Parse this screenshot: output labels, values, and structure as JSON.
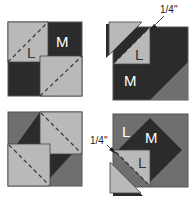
{
  "colors": {
    "dark": "#2b2b2b",
    "medium": "#6f6f6f",
    "light": "#b9b9b9",
    "outline": "#555555",
    "dash": "#333333"
  },
  "panels": [
    {
      "id": "step-1",
      "labels": {
        "large": "L",
        "medium": "M"
      }
    },
    {
      "id": "step-2",
      "labels": {
        "large": "L",
        "medium": "M"
      },
      "seam_allowance": "1/4\""
    },
    {
      "id": "step-3",
      "labels": {}
    },
    {
      "id": "step-4",
      "labels": {
        "large_top": "L",
        "medium": "M",
        "large_bottom": "L"
      },
      "seam_allowance": "1/4\""
    }
  ]
}
